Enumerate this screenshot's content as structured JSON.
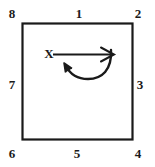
{
  "diagram": {
    "background_color": "#ffffff",
    "ink_color": "#1a1a1a",
    "square": {
      "left": 22,
      "top": 23,
      "right": 133,
      "bottom": 140,
      "stroke_width": 2
    },
    "position_labels": [
      {
        "id": "1",
        "text": "1",
        "location": "top-center"
      },
      {
        "id": "2",
        "text": "2",
        "location": "top-right-corner"
      },
      {
        "id": "3",
        "text": "3",
        "location": "right-center"
      },
      {
        "id": "4",
        "text": "4",
        "location": "bottom-right-corner"
      },
      {
        "id": "5",
        "text": "5",
        "location": "bottom-center"
      },
      {
        "id": "6",
        "text": "6",
        "location": "bottom-left-corner"
      },
      {
        "id": "7",
        "text": "7",
        "location": "left-center"
      },
      {
        "id": "8",
        "text": "8",
        "location": "top-left-corner"
      }
    ],
    "axis_label": {
      "text": "X",
      "description": "label at the tail of the straight rightward arrow"
    },
    "arrows": [
      {
        "id": "straight-arrow",
        "direction": "right",
        "shape": "straight",
        "from_x": 53,
        "to_x": 114,
        "y": 54
      },
      {
        "id": "curved-arrow",
        "direction": "left",
        "shape": "u-curve",
        "description": "arc sweeping from lower right up and back to the left with arrowhead pointing up-left"
      }
    ]
  }
}
